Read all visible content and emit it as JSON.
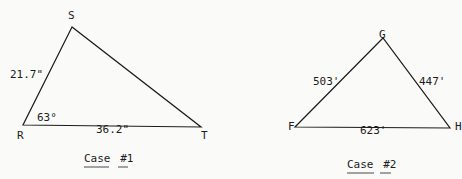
{
  "case1": {
    "vertices": {
      "S": "S",
      "R": "R",
      "T": "T"
    },
    "side_RS": "21.7\"",
    "side_RT": "36.2\"",
    "angle_R": "63°",
    "caption_word": "Case",
    "caption_num_prefix": "#",
    "caption_num": "1"
  },
  "case2": {
    "vertices": {
      "G": "G",
      "F": "F",
      "H": "H"
    },
    "side_FG": "503'",
    "side_GH": "447'",
    "side_FH": "623'",
    "caption_word": "Case",
    "caption_num_prefix": "#",
    "caption_num": "2"
  },
  "colors": {
    "line": "#1c1c1c",
    "paper": "#fafaf8"
  }
}
